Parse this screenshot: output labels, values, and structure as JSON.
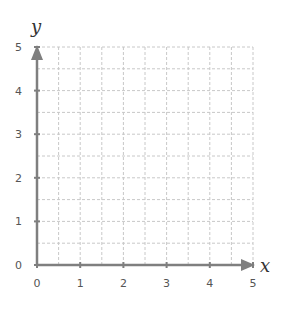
{
  "chart_data": {
    "type": "scatter",
    "title": "",
    "xlabel": "x",
    "ylabel": "y",
    "xlim": [
      0,
      5
    ],
    "ylim": [
      0,
      5
    ],
    "x_ticks": [
      "0",
      "1",
      "2",
      "3",
      "4",
      "5"
    ],
    "y_ticks": [
      "0",
      "1",
      "2",
      "3",
      "4",
      "5"
    ],
    "grid": true,
    "grid_step": 0.5,
    "grid_style": "dashed",
    "series": [],
    "colors": {
      "axis": "#7f7f7f",
      "grid": "#c8c8c8",
      "text": "#555555"
    }
  }
}
